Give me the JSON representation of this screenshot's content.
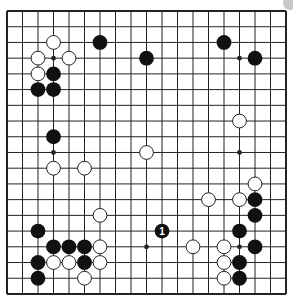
{
  "board": {
    "size": 19,
    "origin_x": 7,
    "origin_y": 11,
    "step_x": 15.5,
    "step_y": 15.72,
    "line_color": "#222222",
    "background": "#ffffff",
    "hoshi": [
      [
        3,
        3
      ],
      [
        9,
        3
      ],
      [
        15,
        3
      ],
      [
        3,
        9
      ],
      [
        9,
        9
      ],
      [
        15,
        9
      ],
      [
        3,
        15
      ],
      [
        9,
        15
      ],
      [
        15,
        15
      ]
    ],
    "black_stones": [
      [
        6,
        2
      ],
      [
        14,
        2
      ],
      [
        9,
        3
      ],
      [
        16,
        3
      ],
      [
        3,
        4
      ],
      [
        2,
        5
      ],
      [
        3,
        5
      ],
      [
        3,
        8
      ],
      [
        16,
        12
      ],
      [
        16,
        13
      ],
      [
        2,
        14
      ],
      [
        15,
        14
      ],
      [
        3,
        15
      ],
      [
        4,
        15
      ],
      [
        5,
        15
      ],
      [
        16,
        15
      ],
      [
        2,
        16
      ],
      [
        5,
        16
      ],
      [
        15,
        16
      ],
      [
        2,
        17
      ],
      [
        15,
        17
      ]
    ],
    "white_stones": [
      [
        3,
        2
      ],
      [
        2,
        3
      ],
      [
        4,
        3
      ],
      [
        2,
        4
      ],
      [
        15,
        7
      ],
      [
        9,
        9
      ],
      [
        3,
        10
      ],
      [
        5,
        10
      ],
      [
        16,
        11
      ],
      [
        13,
        12
      ],
      [
        15,
        12
      ],
      [
        6,
        13
      ],
      [
        6,
        15
      ],
      [
        12,
        15
      ],
      [
        14,
        15
      ],
      [
        3,
        16
      ],
      [
        4,
        16
      ],
      [
        6,
        16
      ],
      [
        14,
        16
      ],
      [
        5,
        17
      ],
      [
        14,
        17
      ]
    ],
    "numbered_stones": [
      {
        "col": 10,
        "row": 14,
        "color": "black",
        "label": "1"
      }
    ]
  },
  "colors": {
    "black_stone": "#111111",
    "white_stone": "#ffffff",
    "white_stone_outline": "#222222",
    "number_on_black": "#ffffff",
    "corner_dot": "#c8c8c8"
  }
}
